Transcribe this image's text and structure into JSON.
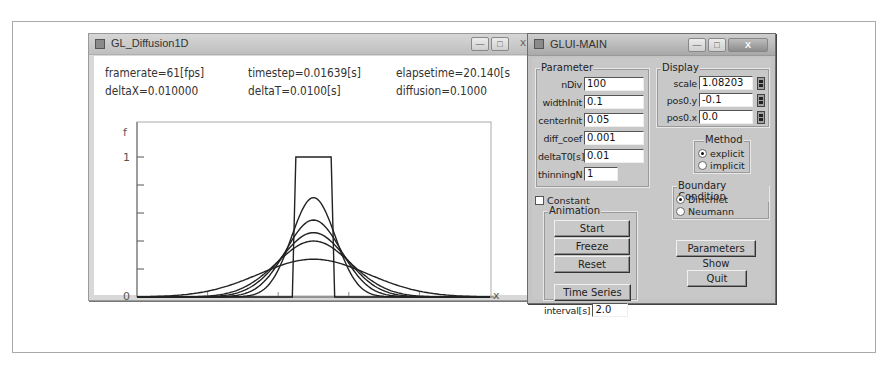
{
  "gl_window": {
    "title": "GL_Diffusion1D",
    "controls": {
      "minimize": "—",
      "maximize": "□",
      "close": "X"
    },
    "info": {
      "framerate": "framerate=61[fps]",
      "timestep": "timestep=0.01639[s]",
      "elapsetime": "elapsetime=20.140[s",
      "deltaX": "deltaX=0.010000",
      "deltaT": "deltaT=0.0100[s]",
      "diffusion": "diffusion=0.1000"
    }
  },
  "chart_data": {
    "type": "line",
    "title": "",
    "xlabel": "x",
    "ylabel": "f",
    "xlim": [
      0,
      1
    ],
    "ylim": [
      0,
      1
    ],
    "x_tick_labels": [
      "0",
      "1"
    ],
    "y_tick_labels": [
      "0",
      "1"
    ],
    "y_ticks": [
      0,
      0.2,
      0.4,
      0.6,
      0.8,
      1.0
    ],
    "x_ticks": [
      0,
      0.2,
      0.4,
      0.6,
      0.8,
      1.0
    ],
    "grid": false,
    "legend": null,
    "series": [
      {
        "name": "initial (rect pulse)",
        "shape": "rect",
        "x_start": 0.45,
        "x_end": 0.55,
        "height": 1.0,
        "base_left": 0.44,
        "base_right": 0.56
      },
      {
        "name": "t1",
        "shape": "gauss",
        "center": 0.5,
        "peak": 0.71,
        "sigma": 0.062
      },
      {
        "name": "t2",
        "shape": "gauss",
        "center": 0.5,
        "peak": 0.55,
        "sigma": 0.078
      },
      {
        "name": "t3",
        "shape": "gauss",
        "center": 0.5,
        "peak": 0.46,
        "sigma": 0.092
      },
      {
        "name": "t4",
        "shape": "gauss",
        "center": 0.5,
        "peak": 0.4,
        "sigma": 0.105
      },
      {
        "name": "t5",
        "shape": "gauss",
        "center": 0.5,
        "peak": 0.27,
        "sigma": 0.155
      }
    ]
  },
  "glui": {
    "title": "GLUI-MAIN",
    "controls": {
      "minimize": "—",
      "maximize": "□",
      "close": "X"
    },
    "parameter": {
      "title": "Parameter",
      "fields": [
        {
          "label": "nDiv",
          "value": "100"
        },
        {
          "label": "widthInit",
          "value": "0.1"
        },
        {
          "label": "centerInit",
          "value": "0.05"
        },
        {
          "label": "diff_coef",
          "value": "0.001"
        },
        {
          "label": "deltaT0[s]",
          "value": "0.01"
        },
        {
          "label": "thinningN",
          "value": "1"
        }
      ]
    },
    "display": {
      "title": "Display",
      "fields": [
        {
          "label": "scale",
          "value": "1.08203"
        },
        {
          "label": "pos0.y",
          "value": "-0.1"
        },
        {
          "label": "pos0.x",
          "value": "0.0"
        }
      ]
    },
    "method": {
      "title": "Method",
      "options": [
        {
          "label": "explicit",
          "selected": true
        },
        {
          "label": "implicit",
          "selected": false
        }
      ]
    },
    "boundary": {
      "title": "Boundary Condition",
      "options": [
        {
          "label": "Dirichlet",
          "selected": true
        },
        {
          "label": "Neumann",
          "selected": false
        }
      ]
    },
    "constant_label": "Constant",
    "constant_checked": false,
    "animation": {
      "title": "Animation",
      "start": "Start",
      "freeze": "Freeze",
      "reset": "Reset"
    },
    "time_series": "Time Series",
    "interval_label": "interval[s]",
    "interval_value": "2.0",
    "parameters_show": "Parameters Show",
    "quit": "Quit"
  }
}
